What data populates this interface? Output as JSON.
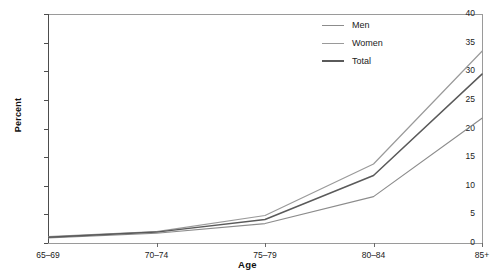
{
  "chart_data": {
    "type": "line",
    "title": "",
    "xlabel": "Age",
    "ylabel": "Percent",
    "categories": [
      "65–69",
      "70–74",
      "75–79",
      "80–84",
      "85+"
    ],
    "ylim": [
      0,
      40
    ],
    "yticks": [
      0,
      5,
      10,
      15,
      20,
      25,
      30,
      35,
      40
    ],
    "ytick_labels": [
      "0",
      "5",
      "10",
      "15",
      "20",
      "25",
      "30",
      "35",
      "40"
    ],
    "grid": false,
    "legend_position": "top-right",
    "series": [
      {
        "name": "Men",
        "color": "#8c8c8c",
        "values": [
          0.9,
          1.7,
          3.4,
          8.1,
          21.8
        ]
      },
      {
        "name": "Women",
        "color": "#9a9a9a",
        "values": [
          1.1,
          2.0,
          4.8,
          13.8,
          33.5
        ]
      },
      {
        "name": "Total",
        "color": "#5a5a5a",
        "values": [
          1.0,
          1.9,
          4.1,
          11.8,
          29.5
        ]
      }
    ]
  },
  "legend": {
    "items": [
      {
        "label": "Men"
      },
      {
        "label": "Women"
      },
      {
        "label": "Total"
      }
    ]
  },
  "axes": {
    "y_title": "Percent",
    "x_title": "Age"
  }
}
